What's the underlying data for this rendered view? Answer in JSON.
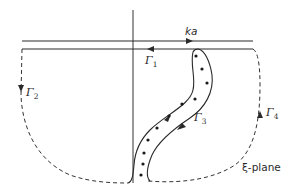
{
  "diagram": {
    "type": "complex-plane contour diagram",
    "plane_label": "ξ-plane",
    "labels": {
      "ka": "ka",
      "gamma1": {
        "symbol": "Γ",
        "sub": "1"
      },
      "gamma2": {
        "symbol": "Γ",
        "sub": "2"
      },
      "gamma3": {
        "symbol": "Γ",
        "sub": "3"
      },
      "gamma4": {
        "symbol": "Γ",
        "sub": "4"
      }
    },
    "elements": [
      {
        "name": "imaginary-axis",
        "style": "solid vertical line"
      },
      {
        "name": "upper-line",
        "style": "solid horizontal, arrow pointing right, labelled ka"
      },
      {
        "name": "lower-line",
        "style": "solid horizontal, arrow pointing left, contour Γ1"
      },
      {
        "name": "left-arc",
        "style": "dashed, arrow pointing down, contour Γ2"
      },
      {
        "name": "branch-cut-band",
        "style": "S-shaped solid loop enclosing dots, contour Γ3"
      },
      {
        "name": "right-arc",
        "style": "dashed, arrow pointing up, contour Γ4"
      }
    ],
    "dot_count": 11
  }
}
